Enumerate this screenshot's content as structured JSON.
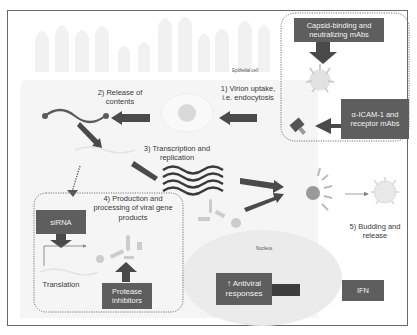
{
  "diagram": {
    "cell_label": "Epithelial cell",
    "nucleus_label": "Nucleus",
    "steps": [
      {
        "id": "step1",
        "label": "1) Virion uptake, i.e. endocytosis",
        "line1": "1) Virion uptake,",
        "line2": "i.e. endocytosis"
      },
      {
        "id": "step2",
        "label": "2) Release of contents",
        "line1": "2) Release of",
        "line2": "contents"
      },
      {
        "id": "step3",
        "label": "3) Transcription and replication",
        "line1": "3) Transcription and",
        "line2": "replication"
      },
      {
        "id": "step4",
        "label": "4) Production and processing of viral gene products",
        "line1": "4) Production and",
        "line2": "processing of viral gene",
        "line3": "products"
      },
      {
        "id": "step5",
        "label": "5) Budding and release",
        "line1": "5) Budding and",
        "line2": "release"
      }
    ],
    "translation_label": "Translation",
    "interventions": [
      {
        "id": "capsid",
        "line1": "Capsid-binding and",
        "line2": "neutralizing mAbs"
      },
      {
        "id": "icam",
        "line1": "α-ICAM-1 and",
        "line2": "receptor mAbs"
      },
      {
        "id": "sirna",
        "line1": "siRNA"
      },
      {
        "id": "protease",
        "line1": "Protease",
        "line2": "inhibitors"
      },
      {
        "id": "ifn",
        "line1": "IFN"
      },
      {
        "id": "antiviral",
        "line1": "↑ Antiviral",
        "line2": "responses"
      }
    ],
    "colors": {
      "box_fill": "#5e5e5e",
      "arrow_fill": "#4a4a4a",
      "virion": "#d9d9d9",
      "cell_fill": "#f4f4f4",
      "microvilli": "#f0f0f0"
    }
  }
}
